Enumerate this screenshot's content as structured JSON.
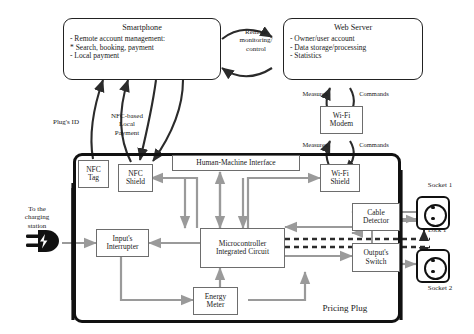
{
  "diagram": {
    "enclosure_label": "Pricing Plug"
  },
  "top_nodes": {
    "smartphone": {
      "title": "Smartphone",
      "lines": [
        "-  Remote account management:",
        "    * Search, booking, payment",
        "-  Local payment"
      ],
      "line1": "-  Remote account management:",
      "line2": "    * Search, booking, payment",
      "line3": "-  Local payment"
    },
    "web_server": {
      "title": "Web Server",
      "line1": "-  Owner/user account",
      "line2": "-  Data storage/processing",
      "line3": "-  Statistics"
    }
  },
  "edge_labels": {
    "remote_monitoring": "Remote\nmonitoring/\ncontrol",
    "remote_monitoring_l1": "Remote",
    "remote_monitoring_l2": "monitoring/",
    "remote_monitoring_l3": "control",
    "plugs_id": "Plug's ID",
    "nfc_local_payment_l1": "NFC-based",
    "nfc_local_payment_l2": "Local",
    "nfc_local_payment_l3": "Payment",
    "measures_upper": "Measures",
    "commands_upper": "Commands",
    "measures_lower": "Measures",
    "commands_lower": "Commands",
    "to_charging_station_l1": "To the",
    "to_charging_station_l2": "charging",
    "to_charging_station_l3": "station",
    "lock1": "Lock 1",
    "lock2": "Lock 2"
  },
  "components": {
    "wifi_modem_l1": "Wi-Fi",
    "wifi_modem_l2": "Modem",
    "nfc_tag_l1": "NFC",
    "nfc_tag_l2": "Tag",
    "nfc_shield_l1": "NFC",
    "nfc_shield_l2": "Shield",
    "hmi": "Human-Machine Interface",
    "wifi_shield_l1": "Wi-Fi",
    "wifi_shield_l2": "Shield",
    "cable_detector_l1": "Cable",
    "cable_detector_l2": "Detector",
    "inputs_interrupter_l1": "Input's",
    "inputs_interrupter_l2": "Interrupter",
    "mcu_l1": "Microcontroller",
    "mcu_l2": "Integrated Circuit",
    "outputs_switch_l1": "Output's",
    "outputs_switch_l2": "Switch",
    "energy_meter_l1": "Energy",
    "energy_meter_l2": "Meter",
    "socket1": "Socket 1",
    "socket2": "Socket 2"
  },
  "icons": {
    "power_plug": "power-plug-icon",
    "socket_outlet": "socket-outlet-icon"
  },
  "colors": {
    "ink": "#1a1a1a",
    "thick_border": "#111111",
    "thin_border": "#6d6d6d",
    "gray_wire": "#9a9a9a",
    "black_wire": "#2b2b2b",
    "background": "#ffffff"
  }
}
